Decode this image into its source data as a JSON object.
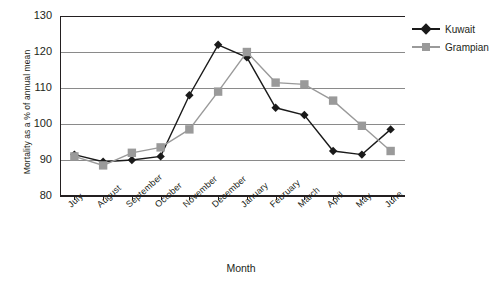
{
  "chart_data": {
    "type": "line",
    "title": "",
    "xlabel": "Month",
    "ylabel": "Mortality as a % of annual mean",
    "categories": [
      "July",
      "August",
      "September",
      "October",
      "November",
      "December",
      "January",
      "February",
      "March",
      "April",
      "May",
      "June"
    ],
    "ylim": [
      80,
      130
    ],
    "yticks": [
      80,
      90,
      100,
      110,
      120,
      130
    ],
    "grid": true,
    "legend_position": "right",
    "series": [
      {
        "name": "Kuwait",
        "color": "#1a1a1a",
        "marker": "diamond",
        "values": [
          91.5,
          89.5,
          90.0,
          91.0,
          108.0,
          122.0,
          118.5,
          104.5,
          102.5,
          92.5,
          91.5,
          98.5
        ]
      },
      {
        "name": "Grampian",
        "color": "#9a9a9a",
        "marker": "square",
        "values": [
          91.0,
          88.5,
          92.0,
          93.5,
          98.5,
          109.0,
          120.0,
          111.5,
          111.0,
          106.5,
          99.5,
          92.5
        ]
      }
    ]
  },
  "legend": {
    "items": [
      {
        "label": "Kuwait"
      },
      {
        "label": "Grampian"
      }
    ]
  }
}
